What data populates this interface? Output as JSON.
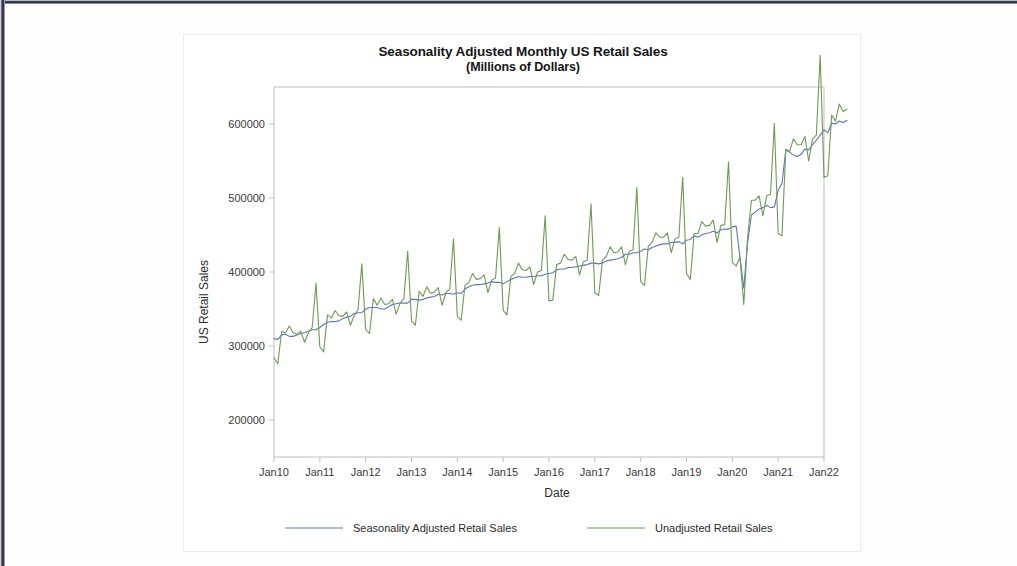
{
  "figure": {
    "title": "Seasonality Adjusted Monthly US Retail Sales",
    "subtitle": "(Millions of Dollars)"
  },
  "chart_data": {
    "type": "line",
    "title": "Seasonality Adjusted Monthly US Retail Sales",
    "subtitle": "(Millions of Dollars)",
    "xlabel": "Date",
    "ylabel": "US Retail Sales",
    "grid": false,
    "legend_position": "bottom",
    "ylim": [
      150000,
      650000
    ],
    "yticks": [
      200000,
      300000,
      400000,
      500000,
      600000
    ],
    "ytick_labels": [
      "200000",
      "300000",
      "400000",
      "500000",
      "600000"
    ],
    "xtick_labels": [
      "Jan10",
      "Jan11",
      "Jan12",
      "Jan13",
      "Jan14",
      "Jan15",
      "Jan16",
      "Jan17",
      "Jan18",
      "Jan19",
      "Jan20",
      "Jan21",
      "Jan22"
    ],
    "x_start": "2010-01",
    "x_end": "2022-07",
    "colors": {
      "seasonally_adjusted": "#5a79b4",
      "unadjusted": "#6f9a55"
    },
    "series": [
      {
        "name": "Seasonality Adjusted Retail Sales",
        "color": "#5a79b4",
        "values": [
          310000,
          309000,
          315000,
          316000,
          313000,
          313000,
          315000,
          317000,
          318000,
          320000,
          322000,
          322000,
          325000,
          329000,
          332000,
          333000,
          333000,
          334000,
          337000,
          339000,
          340000,
          344000,
          345000,
          345000,
          350000,
          352000,
          352000,
          352000,
          350000,
          350000,
          353000,
          356000,
          357000,
          358000,
          358000,
          358000,
          363000,
          363000,
          362000,
          363000,
          365000,
          366000,
          367000,
          370000,
          369000,
          371000,
          371000,
          370000,
          372000,
          371000,
          377000,
          380000,
          382000,
          383000,
          383000,
          384000,
          385000,
          387000,
          386000,
          386000,
          384000,
          387000,
          390000,
          392000,
          394000,
          393000,
          393000,
          394000,
          394000,
          395000,
          395000,
          397000,
          398000,
          399000,
          403000,
          404000,
          404000,
          406000,
          406000,
          407000,
          408000,
          409000,
          410000,
          412000,
          412000,
          411000,
          412000,
          415000,
          416000,
          417000,
          418000,
          420000,
          424000,
          424000,
          426000,
          426000,
          428000,
          431000,
          430000,
          433000,
          435000,
          437000,
          438000,
          438000,
          440000,
          440000,
          441000,
          438000,
          443000,
          444000,
          449000,
          447000,
          450000,
          452000,
          453000,
          455000,
          453000,
          457000,
          458000,
          458000,
          461000,
          462000,
          420000,
          378000,
          440000,
          477000,
          481000,
          485000,
          487000,
          490000,
          487000,
          488000,
          510000,
          520000,
          565000,
          562000,
          558000,
          556000,
          559000,
          566000,
          565000,
          572000,
          578000,
          585000,
          592000,
          588000,
          601000,
          600000,
          604000,
          602000,
          605000
        ]
      },
      {
        "name": "Unadjusted Retail Sales",
        "color": "#6f9a55",
        "values": [
          284000,
          276000,
          320000,
          318000,
          327000,
          318000,
          316000,
          320000,
          305000,
          318000,
          325000,
          385000,
          299000,
          292000,
          342000,
          338000,
          348000,
          341000,
          340000,
          346000,
          328000,
          341000,
          349000,
          411000,
          322000,
          317000,
          364000,
          355000,
          365000,
          356000,
          357000,
          363000,
          343000,
          358000,
          364000,
          428000,
          334000,
          328000,
          374000,
          367000,
          380000,
          371000,
          373000,
          379000,
          355000,
          372000,
          377000,
          445000,
          340000,
          335000,
          382000,
          386000,
          398000,
          390000,
          391000,
          396000,
          372000,
          389000,
          392000,
          460000,
          348000,
          342000,
          394000,
          398000,
          412000,
          403000,
          402000,
          407000,
          383000,
          400000,
          402000,
          476000,
          361000,
          362000,
          410000,
          412000,
          424000,
          417000,
          416000,
          421000,
          396000,
          414000,
          416000,
          492000,
          372000,
          368000,
          416000,
          421000,
          434000,
          426000,
          427000,
          434000,
          410000,
          428000,
          430000,
          514000,
          387000,
          382000,
          435000,
          440000,
          453000,
          447000,
          447000,
          453000,
          426000,
          445000,
          447000,
          528000,
          398000,
          390000,
          452000,
          452000,
          468000,
          462000,
          463000,
          470000,
          440000,
          463000,
          464000,
          549000,
          413000,
          408000,
          420000,
          356000,
          447000,
          497000,
          497000,
          503000,
          476000,
          503000,
          505000,
          601000,
          452000,
          449000,
          566000,
          563000,
          580000,
          572000,
          572000,
          583000,
          550000,
          580000,
          585000,
          693000,
          528000,
          530000,
          612000,
          604000,
          627000,
          617000,
          620000
        ]
      }
    ]
  },
  "legend": {
    "items": [
      {
        "label": "Seasonality Adjusted Retail Sales",
        "color": "#5a79b4"
      },
      {
        "label": "Unadjusted Retail Sales",
        "color": "#6f9a55"
      }
    ]
  }
}
